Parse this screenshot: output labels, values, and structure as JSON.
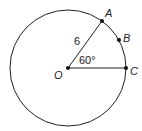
{
  "diagram": {
    "type": "circle-sector",
    "center": {
      "label": "O",
      "x": 68,
      "y": 68
    },
    "radius_px": 58,
    "points": [
      {
        "label": "A",
        "x": 102,
        "y": 21
      },
      {
        "label": "B",
        "x": 119,
        "y": 40
      },
      {
        "label": "C",
        "x": 126,
        "y": 68
      }
    ],
    "radius_label": "6",
    "angle_label": "60°",
    "colors": {
      "stroke": "#222222",
      "background": "#ffffff"
    }
  }
}
